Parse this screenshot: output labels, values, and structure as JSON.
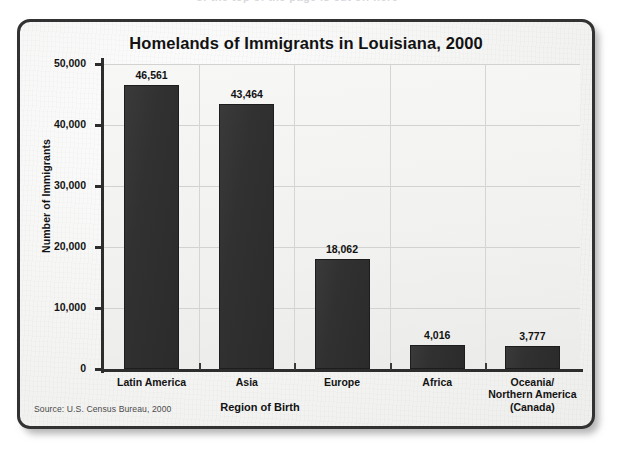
{
  "artifact": {
    "top_smudge": "of the top of the page is cut off here"
  },
  "chart_data": {
    "type": "bar",
    "title": "Homelands of Immigrants in Louisiana, 2000",
    "xlabel": "Region of Birth",
    "ylabel": "Number of Immigrants",
    "categories": [
      "Latin America",
      "Asia",
      "Europe",
      "Africa",
      "Oceania/\nNorthern America\n(Canada)"
    ],
    "category_lines": [
      [
        "Latin America"
      ],
      [
        "Asia"
      ],
      [
        "Europe"
      ],
      [
        "Africa"
      ],
      [
        "Oceania/",
        "Northern America",
        "(Canada)"
      ]
    ],
    "values": [
      46561,
      43464,
      18062,
      4016,
      3777
    ],
    "value_labels": [
      "46,561",
      "43,464",
      "18,062",
      "4,016",
      "3,777"
    ],
    "ylim": [
      0,
      50000
    ],
    "yticks": [
      0,
      10000,
      20000,
      30000,
      40000,
      50000
    ],
    "ytick_labels": [
      "0",
      "10,000",
      "20,000",
      "30,000",
      "40,000",
      "50,000"
    ],
    "grid": true,
    "legend": null,
    "source": "Source: U.S. Census Bureau, 2000",
    "bar_color": "#2e2e2e",
    "plot_background": "#f2f2f0",
    "panel_border_color": "#323232"
  }
}
